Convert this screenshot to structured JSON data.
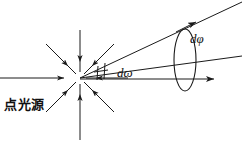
{
  "figure": {
    "type": "optics-solid-angle-diagram",
    "width": 242,
    "height": 142,
    "background": "#ffffff",
    "stroke_color": "#1a1a1a",
    "labels": {
      "source": "点光源",
      "solid_angle": "dω",
      "plane_angle": "dφ"
    },
    "elements": {
      "point_source_dot": {
        "name": "point-source",
        "cx": 80,
        "cy": 78,
        "r": 5,
        "fill": "#111111"
      },
      "radiating_rays": {
        "count": 8,
        "direction": "inward-arrowheads",
        "length": 46,
        "angles_deg": [
          0,
          45,
          90,
          135,
          180,
          225,
          270,
          315
        ]
      },
      "cone": {
        "apex_x": 80,
        "apex_y": 78,
        "upper_edge_end": [
          242,
          4
        ],
        "lower_edge_end": [
          242,
          58
        ],
        "axis_end": [
          215,
          79
        ],
        "angle_tick_marks": 2
      },
      "ellipse_aperture": {
        "cx": 185,
        "cy": 60,
        "rx": 11,
        "ry": 31,
        "fill": "none"
      },
      "arrowheads": [
        {
          "name": "upper-cone-arrow",
          "x": 193,
          "y": 22
        },
        {
          "name": "axis-arrow",
          "x": 212,
          "y": 79
        },
        {
          "name": "left-ray-arrow",
          "x": 41,
          "y": 78
        }
      ]
    }
  }
}
